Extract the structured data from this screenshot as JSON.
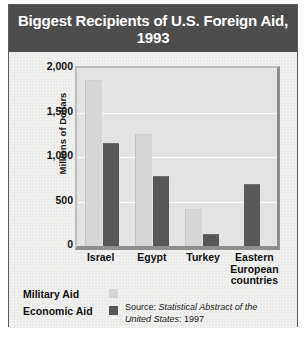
{
  "chart_data": {
    "type": "bar",
    "title": "Biggest Recipients of U.S. Foreign Aid, 1993",
    "xlabel": "",
    "ylabel": "Millions of Dollars",
    "ylim": [
      0,
      2000
    ],
    "yticks": [
      "2,000",
      "1,500",
      "1,000",
      "500",
      "0"
    ],
    "ytick_values": [
      2000,
      1500,
      1000,
      500,
      0
    ],
    "grid": true,
    "legend_position": "bottom-left",
    "categories": [
      "Israel",
      "Egypt",
      "Turkey",
      "Eastern European countries"
    ],
    "category_lines": [
      [
        "Israel"
      ],
      [
        "Egypt"
      ],
      [
        "Turkey"
      ],
      [
        "Eastern",
        "European",
        "countries"
      ]
    ],
    "series": [
      {
        "name": "Military Aid",
        "color": "#d6d6d6",
        "values": [
          1850,
          1250,
          405,
          0
        ]
      },
      {
        "name": "Economic Aid",
        "color": "#585858",
        "values": [
          1150,
          770,
          125,
          690
        ]
      }
    ],
    "source": {
      "prefix": "Source: ",
      "italic": "Statistical Abstract of the United States",
      "suffix": ": 1997"
    }
  },
  "colors": {
    "title_band": "#4d4d4d",
    "title_text": "#ffffff",
    "panel": "#ececeb",
    "plot_bg": "#e3e3e3",
    "gridline": "#fbfbfb",
    "military_aid": "#d6d6d6",
    "economic_aid": "#585858",
    "border": "#5a5a5a"
  },
  "footer": {
    "clipped_text": ""
  }
}
